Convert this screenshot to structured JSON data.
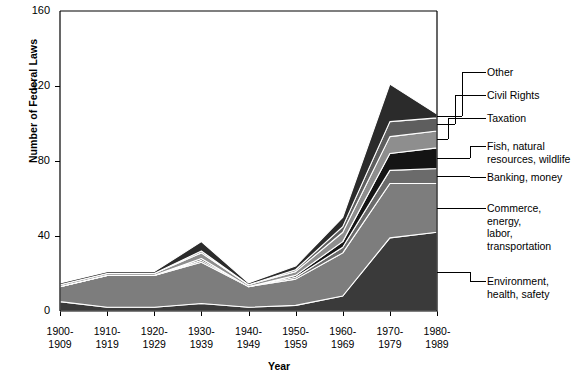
{
  "chart_data": {
    "type": "area",
    "stacked": true,
    "title": "",
    "xlabel": "Year",
    "ylabel": "Number of Federal Laws",
    "ylim": [
      0,
      160
    ],
    "yticks": [
      0,
      40,
      80,
      120,
      160
    ],
    "grid": false,
    "legend_position": "right-callouts",
    "categories": [
      "1900-\n1909",
      "1910-\n1919",
      "1920-\n1929",
      "1930-\n1939",
      "1940-\n1949",
      "1950-\n1959",
      "1960-\n1969",
      "1970-\n1979",
      "1980-\n1989"
    ],
    "series": [
      {
        "name": "Environment, health, safety",
        "color": "#3a3a3a",
        "values": [
          5,
          2,
          2,
          4,
          2,
          3,
          8,
          39,
          42
        ]
      },
      {
        "name": "Commerce, energy, labor, transportation",
        "color": "#7d7d7d",
        "values": [
          8,
          17,
          17,
          22,
          11,
          14,
          23,
          29,
          26
        ]
      },
      {
        "name": "Banking, money",
        "color": "#6b6b6b",
        "values": [
          0,
          0,
          0,
          1,
          0,
          1,
          3,
          7,
          8
        ]
      },
      {
        "name": "Fish, natural resources, wildlife",
        "color": "#141414",
        "values": [
          0,
          0,
          0,
          1,
          0,
          1,
          3,
          9,
          11
        ]
      },
      {
        "name": "Taxation",
        "color": "#8e8e8e",
        "values": [
          1,
          1,
          1,
          3,
          1,
          2,
          5,
          9,
          9
        ]
      },
      {
        "name": "Civil Rights",
        "color": "#5e5e5e",
        "values": [
          0,
          0,
          0,
          1,
          0,
          1,
          3,
          8,
          7
        ]
      },
      {
        "name": "Other",
        "color": "#2b2b2b",
        "values": [
          1,
          1,
          1,
          5,
          1,
          2,
          5,
          20,
          2
        ]
      }
    ],
    "totals": [
      15,
      21,
      21,
      37,
      15,
      24,
      50,
      121,
      105
    ]
  },
  "axes": {
    "y_tick_labels": [
      "160",
      "120",
      "80",
      "40",
      "0"
    ],
    "y_title": "Number of Federal Laws",
    "x_title": "Year"
  },
  "legend": {
    "items": [
      {
        "label": "Other"
      },
      {
        "label": "Civil Rights"
      },
      {
        "label": "Taxation"
      },
      {
        "label": "Fish, natural\nresources, wildlife"
      },
      {
        "label": "Banking, money"
      },
      {
        "label": "Commerce, energy,\nlabor, transportation"
      },
      {
        "label": "Environment,\nhealth, safety"
      }
    ]
  }
}
